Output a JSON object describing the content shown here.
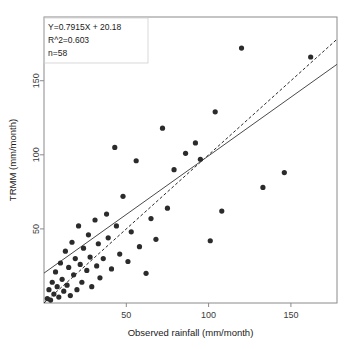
{
  "chart_data": {
    "type": "scatter",
    "title": "",
    "xlabel": "Observed rainfall (mm/month)",
    "ylabel": "TRMM (mm/month)",
    "xlim": [
      0,
      178
    ],
    "ylim": [
      0,
      193
    ],
    "xticks": [
      50,
      100,
      150
    ],
    "yticks": [
      50,
      100,
      150
    ],
    "xtick_labels": [
      "50",
      "100",
      "150"
    ],
    "ytick_labels": [
      "50",
      "100",
      "150"
    ],
    "grid": false,
    "legend": "none",
    "annotations": [
      "Y=0.7915X + 20.18",
      "R^2=0.603",
      "n=58"
    ],
    "regression": {
      "slope": 0.7915,
      "intercept": 20.18,
      "r_squared": 0.603,
      "n": 58,
      "style": "solid"
    },
    "identity_line": {
      "slope": 1.0,
      "intercept": 0.0,
      "style": "dashed"
    },
    "point_color": "#2b2b2b",
    "series": [
      {
        "name": "TRMM vs Observed rainfall",
        "points": [
          [
            2,
            3
          ],
          [
            3,
            9
          ],
          [
            4,
            2
          ],
          [
            5,
            14
          ],
          [
            6,
            6
          ],
          [
            7,
            21
          ],
          [
            8,
            11
          ],
          [
            9,
            4
          ],
          [
            10,
            27
          ],
          [
            11,
            16
          ],
          [
            12,
            8
          ],
          [
            13,
            35
          ],
          [
            14,
            12
          ],
          [
            15,
            24
          ],
          [
            16,
            5
          ],
          [
            17,
            41
          ],
          [
            18,
            19
          ],
          [
            19,
            30
          ],
          [
            20,
            9
          ],
          [
            21,
            52
          ],
          [
            22,
            26
          ],
          [
            23,
            14
          ],
          [
            24,
            37
          ],
          [
            26,
            22
          ],
          [
            27,
            46
          ],
          [
            28,
            31
          ],
          [
            29,
            11
          ],
          [
            31,
            56
          ],
          [
            32,
            25
          ],
          [
            33,
            40
          ],
          [
            34,
            17
          ],
          [
            36,
            30
          ],
          [
            38,
            60
          ],
          [
            39,
            44
          ],
          [
            41,
            23
          ],
          [
            43,
            105
          ],
          [
            44,
            52
          ],
          [
            46,
            33
          ],
          [
            48,
            72
          ],
          [
            51,
            28
          ],
          [
            53,
            48
          ],
          [
            56,
            96
          ],
          [
            58,
            38
          ],
          [
            62,
            20
          ],
          [
            65,
            57
          ],
          [
            68,
            43
          ],
          [
            72,
            118
          ],
          [
            75,
            64
          ],
          [
            79,
            90
          ],
          [
            86,
            101
          ],
          [
            92,
            108
          ],
          [
            95,
            97
          ],
          [
            101,
            42
          ],
          [
            104,
            129
          ],
          [
            108,
            62
          ],
          [
            120,
            172
          ],
          [
            133,
            78
          ],
          [
            146,
            88
          ],
          [
            162,
            166
          ]
        ]
      }
    ]
  },
  "axis": {
    "x_title": "Observed rainfall (mm/month)",
    "y_title": "TRMM (mm/month)"
  }
}
